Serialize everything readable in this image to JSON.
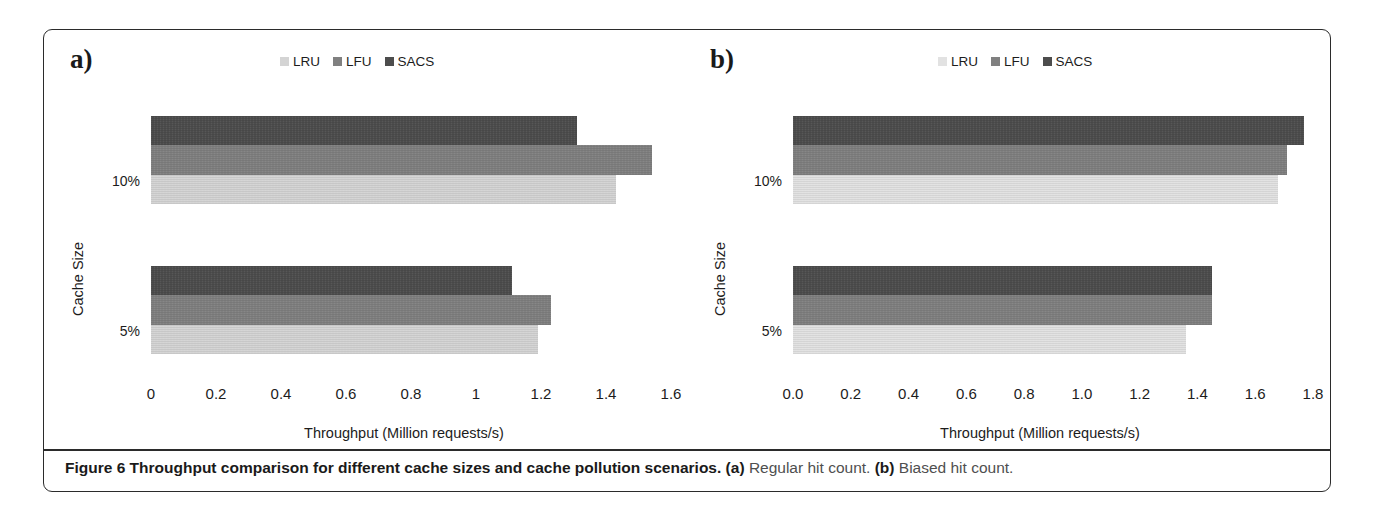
{
  "figure": {
    "caption_bold": "Figure 6 Throughput comparison for different cache sizes and cache pollution scenarios.",
    "caption_a_tag": "(a)",
    "caption_a_text": "Regular hit count.",
    "caption_b_tag": "(b)",
    "caption_b_text": "Biased hit count."
  },
  "colors": {
    "lru": "#d4d4d4",
    "lfu": "#808080",
    "sacs": "#4d4d4d",
    "frame": "#2b2b2b",
    "text": "#231f20"
  },
  "chart_data": [
    {
      "type": "bar",
      "panel": "a",
      "panel_letter": "a)",
      "orientation": "horizontal",
      "title": "",
      "xlabel": "Throughput (Million requests/s)",
      "ylabel": "Cache Size",
      "categories": [
        "10%",
        "5%"
      ],
      "xticklabels": [
        "0",
        "0.2",
        "0.4",
        "0.6",
        "0.8",
        "1",
        "1.2",
        "1.4",
        "1.6"
      ],
      "xticks": [
        0,
        0.2,
        0.4,
        0.6,
        0.8,
        1,
        1.2,
        1.4,
        1.6
      ],
      "xlim": [
        0,
        1.6
      ],
      "grid": false,
      "legend_position": "top-center",
      "series": [
        {
          "name": "LRU",
          "color": "#d4d4d4",
          "values": [
            1.43,
            1.19
          ]
        },
        {
          "name": "LFU",
          "color": "#808080",
          "values": [
            1.54,
            1.23
          ]
        },
        {
          "name": "SACS",
          "color": "#4d4d4d",
          "values": [
            1.31,
            1.11
          ]
        }
      ]
    },
    {
      "type": "bar",
      "panel": "b",
      "panel_letter": "b)",
      "orientation": "horizontal",
      "title": "",
      "xlabel": "Throughput (Million requests/s)",
      "ylabel": "Cache Size",
      "categories": [
        "10%",
        "5%"
      ],
      "xticklabels": [
        "0.0",
        "0.2",
        "0.4",
        "0.6",
        "0.8",
        "1.0",
        "1.2",
        "1.4",
        "1.6",
        "1.8"
      ],
      "xticks": [
        0,
        0.2,
        0.4,
        0.6,
        0.8,
        1.0,
        1.2,
        1.4,
        1.6,
        1.8
      ],
      "xlim": [
        0,
        1.8
      ],
      "grid": false,
      "legend_position": "top-center",
      "series": [
        {
          "name": "LRU",
          "color": "#e2e2e2",
          "values": [
            1.68,
            1.36
          ]
        },
        {
          "name": "LFU",
          "color": "#808080",
          "values": [
            1.71,
            1.45
          ]
        },
        {
          "name": "SACS",
          "color": "#4d4d4d",
          "values": [
            1.77,
            1.45
          ]
        }
      ]
    }
  ]
}
